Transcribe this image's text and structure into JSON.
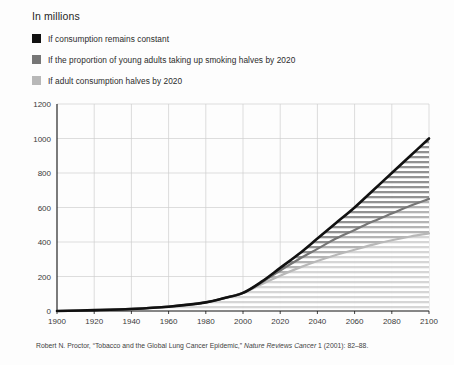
{
  "units_label": "In millions",
  "legend": {
    "items": [
      {
        "label": "If consumption remains constant",
        "color": "#111111"
      },
      {
        "label": "If the proportion of young adults taking up smoking halves by 2020",
        "color": "#767676"
      },
      {
        "label": "If adult consumption halves by 2020",
        "color": "#b8b8b8"
      }
    ]
  },
  "source": {
    "prefix": "Robert N. Proctor, “Tobacco and the Global Lung Cancer Epidemic,” ",
    "journal": "Nature Reviews Cancer",
    "suffix": " 1 (2001): 82–88."
  },
  "chart_data": {
    "type": "line",
    "title": "",
    "subtitle": "",
    "xlabel": "",
    "ylabel": "In millions",
    "xlim": [
      1900,
      2100
    ],
    "ylim": [
      0,
      1200
    ],
    "xticks": [
      1900,
      1920,
      1940,
      1960,
      1980,
      2000,
      2020,
      2040,
      2060,
      2080,
      2100
    ],
    "yticks": [
      0,
      200,
      400,
      600,
      800,
      1000,
      1200
    ],
    "grid": true,
    "legend_position": "above-plot",
    "x": [
      1900,
      1920,
      1940,
      1960,
      1980,
      1990,
      2000,
      2010,
      2020,
      2030,
      2040,
      2050,
      2060,
      2070,
      2080,
      2090,
      2100
    ],
    "series": [
      {
        "name": "If consumption remains constant",
        "color": "#111111",
        "values": [
          0,
          5,
          12,
          25,
          50,
          75,
          105,
          170,
          250,
          330,
          420,
          510,
          600,
          700,
          800,
          900,
          1000
        ]
      },
      {
        "name": "If the proportion of young adults taking up smoking halves by 2020",
        "color": "#767676",
        "values": [
          0,
          5,
          12,
          25,
          50,
          75,
          105,
          165,
          235,
          300,
          360,
          420,
          470,
          520,
          565,
          610,
          650
        ]
      },
      {
        "name": "If adult consumption halves by 2020",
        "color": "#b8b8b8",
        "values": [
          0,
          5,
          12,
          25,
          50,
          75,
          105,
          155,
          205,
          250,
          290,
          325,
          355,
          385,
          410,
          432,
          450
        ]
      }
    ],
    "annotations": []
  }
}
